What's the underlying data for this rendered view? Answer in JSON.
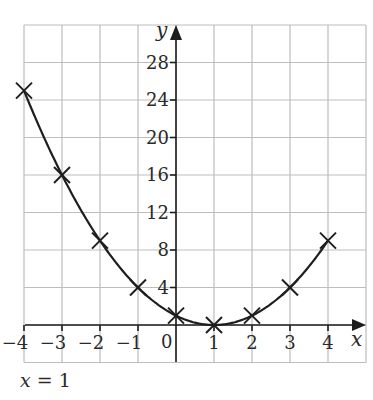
{
  "chart_data": {
    "type": "scatter",
    "title": "",
    "xlabel": "x",
    "ylabel": "y",
    "x": [
      -4,
      -3,
      -2,
      -1,
      0,
      1,
      2,
      3,
      4
    ],
    "series": [
      {
        "name": "y = (x - 1)^2",
        "values": [
          25,
          16,
          9,
          4,
          1,
          0,
          1,
          4,
          9
        ],
        "marker": "x",
        "line": "smooth-curve"
      }
    ],
    "xlim": [
      -4,
      5
    ],
    "ylim": [
      -4,
      32
    ],
    "x_ticks": [
      "-4",
      "-3",
      "-2",
      "-1",
      "0",
      "1",
      "2",
      "3",
      "4"
    ],
    "y_ticks": [
      "4",
      "8",
      "12",
      "16",
      "20",
      "24",
      "28"
    ],
    "grid": true,
    "annotations": [
      "x = 1"
    ]
  },
  "labels": {
    "x_axis": "x",
    "y_axis": "y",
    "origin": "0",
    "x_ticks": [
      "−4",
      "−3",
      "−2",
      "−1",
      "1",
      "2",
      "3",
      "4"
    ],
    "y_ticks": [
      "4",
      "8",
      "12",
      "16",
      "20",
      "24",
      "28"
    ],
    "caption_var": "x",
    "caption_rest": " = 1"
  },
  "colors": {
    "grid": "#bdbdbd",
    "ink": "#1e1e1e",
    "background": "#ffffff"
  }
}
